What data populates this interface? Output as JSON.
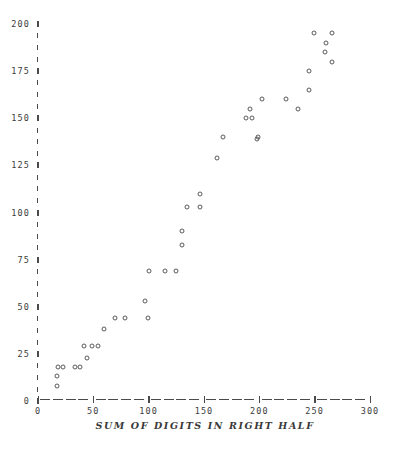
{
  "figure": {
    "background_color": "#ffffff",
    "ink_color": "#4a4a4a",
    "marker_symbol": "o",
    "marker_style": "open-circle"
  },
  "axes": {
    "y_ticks": [
      "0",
      "25",
      "50",
      "75",
      "100",
      "125",
      "150",
      "175",
      "200"
    ],
    "x_ticks": [
      "0",
      "50",
      "100",
      "150",
      "200",
      "250",
      "300"
    ],
    "x_title": "SUM OF DIGITS IN RIGHT HALF",
    "y_title": ""
  },
  "chart_data": {
    "type": "scatter",
    "title": "",
    "xlabel": "SUM OF DIGITS IN RIGHT HALF",
    "ylabel": "",
    "xlim": [
      0,
      300
    ],
    "ylim": [
      0,
      200
    ],
    "xticks": [
      0,
      50,
      100,
      150,
      200,
      250,
      300
    ],
    "yticks": [
      0,
      25,
      50,
      75,
      100,
      125,
      150,
      175,
      200
    ],
    "grid": false,
    "legend": null,
    "marker": "open-circle",
    "points": [
      {
        "x": 17,
        "y": 8
      },
      {
        "x": 17,
        "y": 13
      },
      {
        "x": 18,
        "y": 18
      },
      {
        "x": 23,
        "y": 18
      },
      {
        "x": 33,
        "y": 18
      },
      {
        "x": 38,
        "y": 18
      },
      {
        "x": 44,
        "y": 23
      },
      {
        "x": 42,
        "y": 29
      },
      {
        "x": 49,
        "y": 29
      },
      {
        "x": 54,
        "y": 29
      },
      {
        "x": 60,
        "y": 38
      },
      {
        "x": 70,
        "y": 44
      },
      {
        "x": 79,
        "y": 44
      },
      {
        "x": 99,
        "y": 44
      },
      {
        "x": 97,
        "y": 53
      },
      {
        "x": 100,
        "y": 69
      },
      {
        "x": 115,
        "y": 69
      },
      {
        "x": 125,
        "y": 69
      },
      {
        "x": 130,
        "y": 83
      },
      {
        "x": 130,
        "y": 90
      },
      {
        "x": 135,
        "y": 103
      },
      {
        "x": 146,
        "y": 103
      },
      {
        "x": 146,
        "y": 110
      },
      {
        "x": 162,
        "y": 129
      },
      {
        "x": 167,
        "y": 140
      },
      {
        "x": 198,
        "y": 139
      },
      {
        "x": 199,
        "y": 140
      },
      {
        "x": 188,
        "y": 150
      },
      {
        "x": 193,
        "y": 150
      },
      {
        "x": 192,
        "y": 155
      },
      {
        "x": 202,
        "y": 160
      },
      {
        "x": 224,
        "y": 160
      },
      {
        "x": 235,
        "y": 155
      },
      {
        "x": 245,
        "y": 165
      },
      {
        "x": 245,
        "y": 175
      },
      {
        "x": 249,
        "y": 195
      },
      {
        "x": 266,
        "y": 195
      },
      {
        "x": 260,
        "y": 190
      },
      {
        "x": 259,
        "y": 185
      },
      {
        "x": 266,
        "y": 180
      }
    ]
  }
}
